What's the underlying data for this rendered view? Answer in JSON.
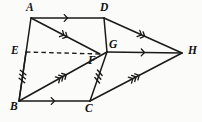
{
  "figure": {
    "background_color": "#fbfbfa",
    "stroke_color": "#1a1a1a",
    "width": 202,
    "height": 122,
    "points": [
      {
        "id": "A",
        "label": "A",
        "x": 31,
        "y": 18,
        "label_x": 26,
        "label_y": 2
      },
      {
        "id": "D",
        "label": "D",
        "x": 104,
        "y": 18,
        "label_x": 100,
        "label_y": 2
      },
      {
        "id": "E",
        "label": "E",
        "x": 26,
        "y": 52,
        "label_x": 11,
        "label_y": 45
      },
      {
        "id": "F",
        "label": "F",
        "x": 100,
        "y": 54,
        "label_x": 88,
        "label_y": 55
      },
      {
        "id": "G",
        "label": "G",
        "x": 107,
        "y": 52,
        "label_x": 109,
        "label_y": 39
      },
      {
        "id": "H",
        "label": "H",
        "x": 182,
        "y": 53,
        "label_x": 188,
        "label_y": 45
      },
      {
        "id": "B",
        "label": "B",
        "x": 19,
        "y": 101,
        "label_x": 10,
        "label_y": 101
      },
      {
        "id": "C",
        "label": "C",
        "x": 90,
        "y": 101,
        "label_x": 85,
        "label_y": 103
      }
    ],
    "segments": [
      {
        "id": "AD",
        "from": "A",
        "to": "D",
        "style": "solid",
        "arrows": 1,
        "ticks": 0
      },
      {
        "id": "AB",
        "from": "A",
        "to": "B",
        "style": "solid",
        "arrows": 0,
        "ticks": 0
      },
      {
        "id": "AF",
        "from": "A",
        "to": "F",
        "style": "solid",
        "arrows": 2,
        "ticks": 0
      },
      {
        "id": "DG",
        "from": "D",
        "to": "G",
        "style": "solid",
        "arrows": 0,
        "ticks": 0
      },
      {
        "id": "DH",
        "from": "D",
        "to": "H",
        "style": "solid",
        "arrows": 2,
        "ticks": 0
      },
      {
        "id": "EF",
        "from": "E",
        "to": "F",
        "style": "dashed",
        "arrows": 0,
        "ticks": 0
      },
      {
        "id": "GH",
        "from": "G",
        "to": "H",
        "style": "solid",
        "arrows": 1,
        "ticks": 0
      },
      {
        "id": "BG",
        "from": "B",
        "to": "G",
        "style": "solid",
        "arrows": 3,
        "ticks": 0
      },
      {
        "id": "BC",
        "from": "B",
        "to": "C",
        "style": "solid",
        "arrows": 1,
        "ticks": 0
      },
      {
        "id": "CG",
        "from": "C",
        "to": "G",
        "style": "solid",
        "arrows": 0,
        "ticks": 3
      },
      {
        "id": "CH",
        "from": "C",
        "to": "H",
        "style": "solid",
        "arrows": 3,
        "ticks": 0
      },
      {
        "id": "EB",
        "from": "E",
        "to": "B",
        "style": "solid",
        "arrows": 0,
        "ticks": 3
      }
    ]
  }
}
